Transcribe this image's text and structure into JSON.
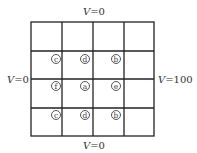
{
  "boundaries": {
    "top": {
      "var": "V",
      "value": "=0"
    },
    "bottom": {
      "var": "V",
      "value": "=0"
    },
    "left": {
      "var": "V",
      "value": "=0"
    },
    "right": {
      "var": "V",
      "value": "=100"
    }
  },
  "grid": {
    "rows": 4,
    "cols": 4
  },
  "nodes": [
    {
      "label": "c",
      "row": 1,
      "col": 1
    },
    {
      "label": "d",
      "row": 1,
      "col": 2
    },
    {
      "label": "b",
      "row": 1,
      "col": 3
    },
    {
      "label": "f",
      "row": 2,
      "col": 1
    },
    {
      "label": "a",
      "row": 2,
      "col": 2
    },
    {
      "label": "e",
      "row": 2,
      "col": 3
    },
    {
      "label": "c",
      "row": 3,
      "col": 1
    },
    {
      "label": "d",
      "row": 3,
      "col": 2
    },
    {
      "label": "b",
      "row": 3,
      "col": 3
    }
  ]
}
